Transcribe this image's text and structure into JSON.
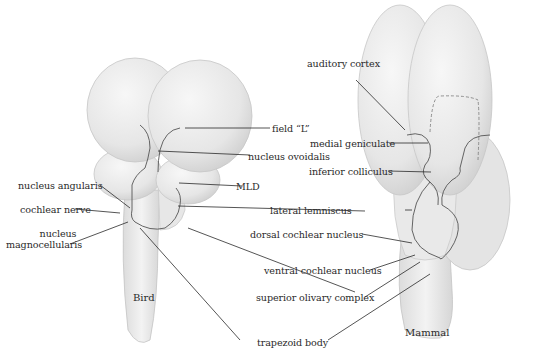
{
  "figure": {
    "panels": [
      {
        "id": "bird",
        "caption": "Bird"
      },
      {
        "id": "mammal",
        "caption": "Mammal"
      }
    ],
    "bird_labels": {
      "nucleus_angularis": "nucleus angularis",
      "cochlear_nerve": "cochlear nerve",
      "nucleus_magnocellularis_l1": "nucleus",
      "nucleus_magnocellularis_l2": "magnocellularis",
      "field_l": "field “L”",
      "nucleus_ovoidalis": "nucleus ovoidalis",
      "mld": "MLD"
    },
    "shared_labels": {
      "lateral_lemniscus": "lateral lemniscus",
      "superior_olivary_complex": "superior olivary complex",
      "trapezoid_body": "trapezoid body"
    },
    "mammal_labels": {
      "auditory_cortex": "auditory cortex",
      "medial_geniculate": "medial geniculate",
      "inferior_colliculus": "inferior colliculus",
      "dorsal_cochlear_nucleus": "dorsal cochlear nucleus",
      "ventral_cochlear_nucleus": "ventral cochlear nucleus"
    },
    "colors": {
      "tissue": "#ececec",
      "tissue_shadow": "#d2d2d2",
      "outline": "#bdbdbd",
      "leader": "#2a2a2a"
    }
  }
}
